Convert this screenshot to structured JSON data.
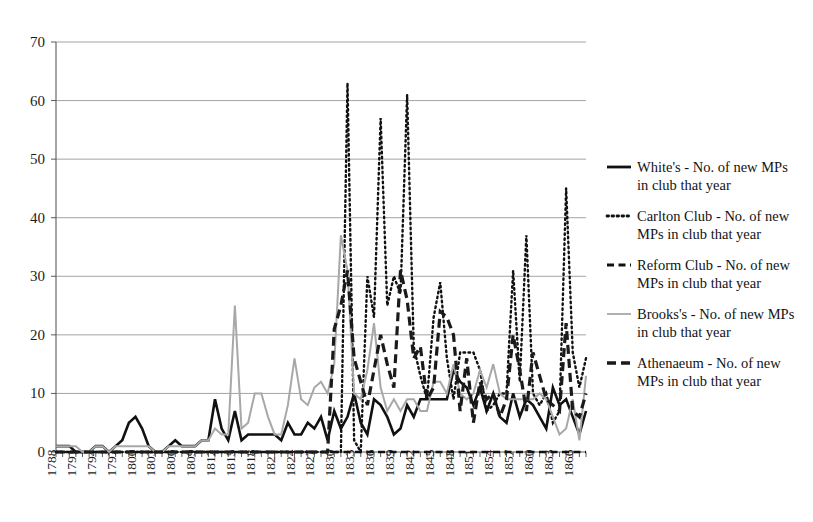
{
  "figure": {
    "background": "#ffffff",
    "plot_left": 56,
    "plot_right": 586,
    "plot_top": 42,
    "plot_bottom": 452
  },
  "chart_data": {
    "type": "line",
    "title": "",
    "subtitle": "",
    "xlabel": "",
    "ylabel": "",
    "ylim": [
      0,
      70
    ],
    "ytick_values": [
      0,
      10,
      20,
      30,
      40,
      50,
      60,
      70
    ],
    "ytick_labels": [
      "0",
      "10",
      "20",
      "30",
      "40",
      "50",
      "60",
      "70"
    ],
    "grid": true,
    "grid_axis": "y",
    "legend_position": "right",
    "x_start": 1788,
    "x_end": 1868,
    "xtick_labels": [
      "1788",
      "1791",
      "1794",
      "1797",
      "1800",
      "1803",
      "1806",
      "1809",
      "1812",
      "1815",
      "1818",
      "1821",
      "1824",
      "1827",
      "1830",
      "1833",
      "1836",
      "1839",
      "1842",
      "1845",
      "1848",
      "1851",
      "1854",
      "1857",
      "1860",
      "1863",
      "1866"
    ],
    "xtick_step": 3,
    "x": [
      1788,
      1789,
      1790,
      1791,
      1792,
      1793,
      1794,
      1795,
      1796,
      1797,
      1798,
      1799,
      1800,
      1801,
      1802,
      1803,
      1804,
      1805,
      1806,
      1807,
      1808,
      1809,
      1810,
      1811,
      1812,
      1813,
      1814,
      1815,
      1816,
      1817,
      1818,
      1819,
      1820,
      1821,
      1822,
      1823,
      1824,
      1825,
      1826,
      1827,
      1828,
      1829,
      1830,
      1831,
      1832,
      1833,
      1834,
      1835,
      1836,
      1837,
      1838,
      1839,
      1840,
      1841,
      1842,
      1843,
      1844,
      1845,
      1846,
      1847,
      1848,
      1849,
      1850,
      1851,
      1852,
      1853,
      1854,
      1855,
      1856,
      1857,
      1858,
      1859,
      1860,
      1861,
      1862,
      1863,
      1864,
      1865,
      1866,
      1867,
      1868
    ],
    "series": [
      {
        "name": "White's -  No. of new MPs in club that year",
        "short_name": "White's",
        "color": "#111111",
        "style": "solid",
        "width": 2.6,
        "values": [
          1,
          1,
          1,
          0,
          0,
          0,
          1,
          1,
          0,
          1,
          2,
          5,
          6,
          4,
          1,
          0,
          0,
          1,
          2,
          1,
          1,
          1,
          2,
          2,
          9,
          4,
          2,
          7,
          2,
          3,
          3,
          3,
          3,
          3,
          2,
          5,
          3,
          3,
          5,
          4,
          6,
          2,
          7,
          4,
          6,
          10,
          5,
          3,
          9,
          8,
          6,
          3,
          4,
          8,
          6,
          9,
          9,
          9,
          9,
          9,
          14,
          12,
          11,
          8,
          11,
          7,
          10,
          6,
          5,
          10,
          6,
          9,
          8,
          6,
          4,
          11,
          8,
          9,
          6,
          3,
          7
        ]
      },
      {
        "name": "Carlton Club - No. of new MPs in club that year",
        "short_name": "Carlton Club",
        "color": "#111111",
        "style": "dotted",
        "width": 2.4,
        "values": [
          0,
          0,
          0,
          0,
          0,
          0,
          0,
          0,
          0,
          0,
          0,
          0,
          0,
          0,
          0,
          0,
          0,
          0,
          0,
          0,
          0,
          0,
          0,
          0,
          0,
          0,
          0,
          0,
          0,
          0,
          0,
          0,
          0,
          0,
          0,
          0,
          0,
          0,
          0,
          0,
          0,
          0,
          0,
          0,
          63,
          2,
          0,
          30,
          23,
          57,
          25,
          30,
          27,
          61,
          18,
          13,
          9,
          23,
          29,
          16,
          9,
          17,
          17,
          17,
          14,
          7,
          8,
          10,
          10,
          31,
          12,
          37,
          10,
          8,
          10,
          5,
          7,
          45,
          17,
          11,
          16
        ]
      },
      {
        "name": "Reform Club -  No. of new MPs in club that year",
        "short_name": "Reform Club",
        "color": "#111111",
        "style": "dashed",
        "width": 2.6,
        "values": [
          0,
          0,
          0,
          0,
          0,
          0,
          0,
          0,
          0,
          0,
          0,
          0,
          0,
          0,
          0,
          0,
          0,
          0,
          0,
          0,
          0,
          0,
          0,
          0,
          0,
          0,
          0,
          0,
          0,
          0,
          0,
          0,
          0,
          0,
          0,
          0,
          0,
          0,
          0,
          0,
          0,
          0,
          0,
          0,
          0,
          0,
          0,
          0,
          0,
          0,
          0,
          0,
          0,
          0,
          0,
          0,
          0,
          0,
          0,
          0,
          0,
          0,
          0,
          0,
          0,
          0,
          0,
          0,
          0,
          0,
          0,
          0,
          0,
          0,
          0,
          0,
          0,
          0,
          0,
          0,
          0
        ]
      },
      {
        "name": "Brooks's -  No. of new MPs in club that year",
        "short_name": "Brooks's",
        "color": "#a8a8a8",
        "style": "solid",
        "width": 2.0,
        "values": [
          1,
          1,
          1,
          1,
          0,
          0,
          1,
          1,
          0,
          1,
          1,
          1,
          1,
          1,
          1,
          0,
          0,
          1,
          1,
          1,
          1,
          1,
          2,
          2,
          4,
          3,
          3,
          25,
          4,
          5,
          10,
          10,
          6,
          3,
          3,
          8,
          16,
          9,
          8,
          11,
          12,
          10,
          15,
          37,
          31,
          10,
          9,
          14,
          22,
          11,
          7,
          9,
          7,
          9,
          9,
          7,
          7,
          12,
          12,
          10,
          15,
          10,
          9,
          10,
          14,
          11,
          15,
          10,
          9,
          9,
          9,
          9,
          9,
          10,
          9,
          6,
          3,
          4,
          9,
          2,
          13
        ]
      },
      {
        "name": "Athenaeum -  No. of new MPs in club that year",
        "short_name": "Athenaeum",
        "color": "#1a1a1a",
        "style": "dashdash",
        "width": 3.2,
        "values": [
          0,
          0,
          0,
          0,
          0,
          0,
          0,
          0,
          0,
          0,
          0,
          0,
          0,
          0,
          0,
          0,
          0,
          0,
          0,
          0,
          0,
          0,
          0,
          0,
          0,
          0,
          0,
          0,
          0,
          0,
          0,
          0,
          0,
          0,
          0,
          0,
          0,
          0,
          0,
          0,
          0,
          0,
          21,
          25,
          31,
          16,
          12,
          8,
          14,
          20,
          15,
          11,
          31,
          26,
          16,
          18,
          9,
          11,
          24,
          23,
          20,
          7,
          16,
          5,
          12,
          9,
          10,
          6,
          9,
          20,
          14,
          7,
          17,
          13,
          9,
          8,
          7,
          22,
          7,
          6,
          10
        ]
      }
    ]
  },
  "legend": {
    "entries": [
      {
        "label_line1": "White's -  No. of new MPs",
        "label_line2": "in club that year",
        "marker": "solid-line-marker"
      },
      {
        "label_line1": "Carlton Club - No. of new",
        "label_line2": "MPs in club that year",
        "marker": "dotted-line-marker"
      },
      {
        "label_line1": "Reform Club -  No. of new",
        "label_line2": "MPs in club that year",
        "marker": "dashed-line-marker"
      },
      {
        "label_line1": "Brooks's -  No. of new MPs",
        "label_line2": "in club that year",
        "marker": "gray-line-marker"
      },
      {
        "label_line1": "Athenaeum -  No. of new",
        "label_line2": "MPs in club that year",
        "marker": "dashdash-line-marker"
      }
    ]
  }
}
